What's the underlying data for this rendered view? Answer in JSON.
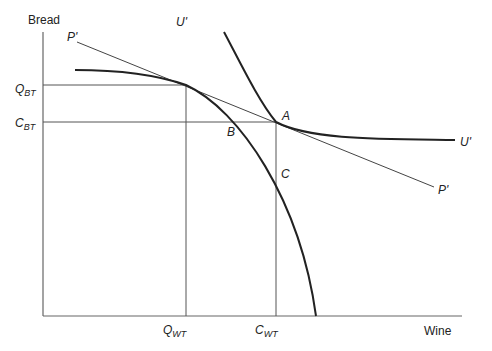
{
  "axes": {
    "y_label": "Bread",
    "x_label": "Wine"
  },
  "curves": {
    "indifference_top_label": "U'",
    "indifference_right_label": "U'",
    "price_line_top_label": "P'",
    "price_line_right_label": "P'"
  },
  "points": {
    "A": "A",
    "B": "B",
    "C": "C"
  },
  "y_ticks": [
    {
      "main": "Q",
      "sub": "BT"
    },
    {
      "main": "C",
      "sub": "BT"
    }
  ],
  "x_ticks": [
    {
      "main": "Q",
      "sub": "WT"
    },
    {
      "main": "C",
      "sub": "WT"
    }
  ],
  "colors": {
    "curve": "#222222",
    "guide": "#555555"
  }
}
